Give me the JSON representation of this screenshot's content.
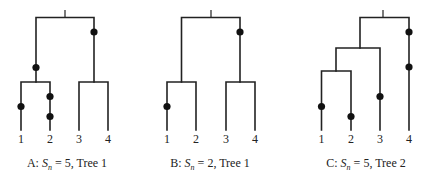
{
  "figure": {
    "panels": [
      {
        "id": "A",
        "caption_prefix": "A: ",
        "caption_s": "S",
        "caption_sub": "n",
        "caption_suffix": " = 5, Tree 1",
        "leaf_labels": [
          "1",
          "2",
          "3",
          "4"
        ],
        "topology": "((1,2),(3,4))",
        "segregating_sites": 5,
        "tree": "Tree 1"
      },
      {
        "id": "B",
        "caption_prefix": "B: ",
        "caption_s": "S",
        "caption_sub": "n",
        "caption_suffix": " = 2, Tree 1",
        "leaf_labels": [
          "1",
          "2",
          "3",
          "4"
        ],
        "topology": "((1,2),(3,4))",
        "segregating_sites": 2,
        "tree": "Tree 1"
      },
      {
        "id": "C",
        "caption_prefix": "C: ",
        "caption_s": "S",
        "caption_sub": "n",
        "caption_suffix": " = 5, Tree 2",
        "leaf_labels": [
          "1",
          "2",
          "3",
          "4"
        ],
        "topology": "(((1,2),3),4)",
        "segregating_sites": 5,
        "tree": "Tree 2"
      }
    ],
    "colors": {
      "line": "#222222",
      "mutation_dot": "#111111",
      "background": "#ffffff"
    }
  }
}
